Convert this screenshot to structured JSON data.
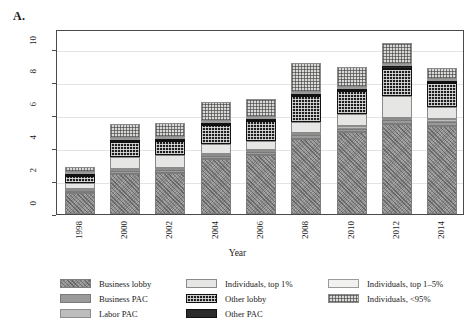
{
  "panel_label": "A.",
  "chart_data": {
    "type": "bar",
    "subtype": "stacked",
    "title": "",
    "xlabel": "Year",
    "ylabel": "2014 $ BN",
    "ylim": [
      0,
      11.2
    ],
    "yticks": [
      0,
      2,
      4,
      6,
      8,
      10
    ],
    "grid": true,
    "legend_position": "bottom",
    "categories": [
      "1998",
      "2000",
      "2002",
      "2004",
      "2006",
      "2008",
      "2010",
      "2012",
      "2014"
    ],
    "series": [
      {
        "name": "Business lobby",
        "color": "#a5a5a5",
        "pattern": "speckle",
        "values": [
          1.3,
          2.45,
          2.5,
          3.35,
          3.6,
          4.55,
          4.95,
          5.45,
          5.35
        ]
      },
      {
        "name": "Business PAC",
        "color": "#9a9a9a",
        "pattern": "solid-gray",
        "values": [
          0.12,
          0.15,
          0.15,
          0.18,
          0.18,
          0.22,
          0.22,
          0.25,
          0.25
        ]
      },
      {
        "name": "Labor PAC",
        "color": "#bdbdbd",
        "pattern": "solid-light",
        "values": [
          0.1,
          0.12,
          0.12,
          0.12,
          0.12,
          0.13,
          0.13,
          0.14,
          0.13
        ]
      },
      {
        "name": "Individuals, top 1%",
        "color": "#e6e6e4",
        "pattern": "very-light",
        "values": [
          0.33,
          0.75,
          0.78,
          0.6,
          0.55,
          0.7,
          0.75,
          1.3,
          0.75
        ]
      },
      {
        "name": "Other lobby",
        "color": "#1f1f1f",
        "pattern": "checkerboard",
        "values": [
          0.45,
          0.9,
          0.9,
          1.15,
          1.2,
          1.55,
          1.4,
          1.65,
          1.45
        ]
      },
      {
        "name": "Other PAC",
        "color": "#2b2b2b",
        "pattern": "solid-dark",
        "values": [
          0.09,
          0.1,
          0.1,
          0.11,
          0.12,
          0.14,
          0.14,
          0.15,
          0.14
        ]
      },
      {
        "name": "Individuals, top 1–5%",
        "color": "#f1f1ef",
        "pattern": "faint",
        "values": [
          0.06,
          0.08,
          0.08,
          0.08,
          0.08,
          0.1,
          0.1,
          0.11,
          0.1
        ]
      },
      {
        "name": "Individuals, <95%",
        "color": "#d9d9d7",
        "pattern": "fine-check",
        "values": [
          0.3,
          0.85,
          0.82,
          1.16,
          1.1,
          1.76,
          1.21,
          1.3,
          0.68
        ]
      }
    ],
    "totals": [
      2.75,
      5.4,
      5.45,
      6.75,
      6.95,
      9.15,
      8.9,
      10.35,
      8.85
    ]
  },
  "legend": {
    "columns": [
      {
        "items": [
          {
            "label": "Business lobby",
            "swatch": "f-bizlobby"
          },
          {
            "label": "Business PAC",
            "swatch": "f-bizpac"
          },
          {
            "label": "Labor PAC",
            "swatch": "f-laborpac"
          }
        ]
      },
      {
        "items": [
          {
            "label": "Individuals, top 1%",
            "swatch": "f-ind1"
          },
          {
            "label": "Other lobby",
            "swatch": "f-otherlobby"
          },
          {
            "label": "Other PAC",
            "swatch": "f-otherpac"
          }
        ]
      },
      {
        "items": [
          {
            "label": "Individuals, top 1–5%",
            "swatch": "f-ind15"
          },
          {
            "label": "Individuals, <95%",
            "swatch": "f-ind95"
          }
        ]
      }
    ]
  }
}
